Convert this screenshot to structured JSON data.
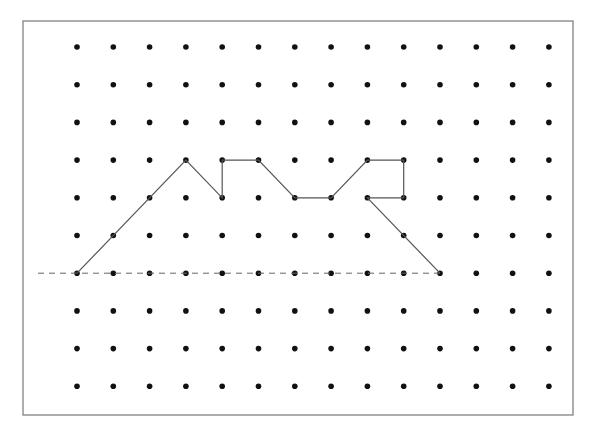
{
  "diagram": {
    "type": "dot-grid-polyline",
    "frame": {
      "x": 23,
      "y": 21,
      "width": 550,
      "height": 394,
      "stroke": "#777777"
    },
    "grid": {
      "columns": 14,
      "rows": 10,
      "origin_x": 77,
      "origin_y": 47,
      "spacing_x": 36.3,
      "spacing_y": 37.7,
      "dot_radius": 2.8,
      "dot_color": "#111111"
    },
    "polyline": {
      "stroke": "#555555",
      "points": [
        [
          0,
          6
        ],
        [
          3,
          3
        ],
        [
          4,
          4
        ],
        [
          4,
          3
        ],
        [
          5,
          3
        ],
        [
          6,
          4
        ],
        [
          7,
          4
        ],
        [
          8,
          3
        ],
        [
          9,
          3
        ],
        [
          9,
          4
        ],
        [
          8,
          4
        ],
        [
          10,
          6
        ]
      ]
    },
    "dashed_line": {
      "row": 6,
      "x_start": 38,
      "x_end": 440,
      "stroke": "#666666"
    }
  }
}
